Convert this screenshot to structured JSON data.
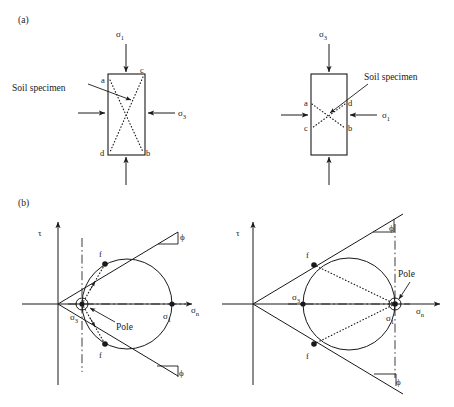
{
  "figure": {
    "panels": [
      {
        "id": "a",
        "label": "(a)"
      },
      {
        "id": "b",
        "label": "(b)"
      }
    ],
    "callout_label": "Soil specimen",
    "pole_label": "Pole",
    "symbols": {
      "sigma": "σ",
      "tau": "τ",
      "phi": "ϕ",
      "sub_1": "1",
      "sub_3": "3",
      "sub_n": "n"
    }
  },
  "panel_a": {
    "label": "(a)",
    "specimen_left": {
      "callout": "Soil specimen",
      "vertical_stress": {
        "sigma": "σ",
        "sub": "1"
      },
      "horizontal_stress": {
        "sigma": "σ",
        "sub": "3"
      },
      "corner_labels": {
        "top_left": "a",
        "top_right": "c",
        "bottom_left": "d",
        "bottom_right": "b"
      }
    },
    "specimen_right": {
      "callout": "Soil specimen",
      "vertical_stress": {
        "sigma": "σ",
        "sub": "3"
      },
      "horizontal_stress": {
        "sigma": "σ",
        "sub": "1"
      },
      "corner_labels": {
        "left_upper": "a",
        "right_upper": "d",
        "left_lower": "c",
        "right_lower": "b"
      }
    }
  },
  "panel_b": {
    "label": "(b)",
    "mohr_left": {
      "axis_y": {
        "sigma": "τ",
        "sub": ""
      },
      "axis_x": {
        "sigma": "σ",
        "sub": "n"
      },
      "envelope_angle": {
        "symbol": "ϕ"
      },
      "sigma3_label": {
        "sigma": "σ",
        "sub": "3"
      },
      "sigma1_label": {
        "sigma": "σ",
        "sub": "1"
      },
      "pole_label": "Pole",
      "failure_point_upper": "f",
      "failure_point_lower": "f",
      "pole_at": "sigma3"
    },
    "mohr_right": {
      "axis_y": {
        "sigma": "τ",
        "sub": ""
      },
      "axis_x": {
        "sigma": "σ",
        "sub": "n"
      },
      "envelope_angle": {
        "symbol": "ϕ"
      },
      "sigma3_label": {
        "sigma": "σ",
        "sub": "3"
      },
      "sigma1_label": {
        "sigma": "σ",
        "sub": "1"
      },
      "pole_label": "Pole",
      "failure_point_upper": "f",
      "failure_point_lower": "f",
      "pole_at": "sigma1"
    }
  },
  "colors": {
    "ink": "#1a1a1a",
    "background": "#ffffff"
  }
}
